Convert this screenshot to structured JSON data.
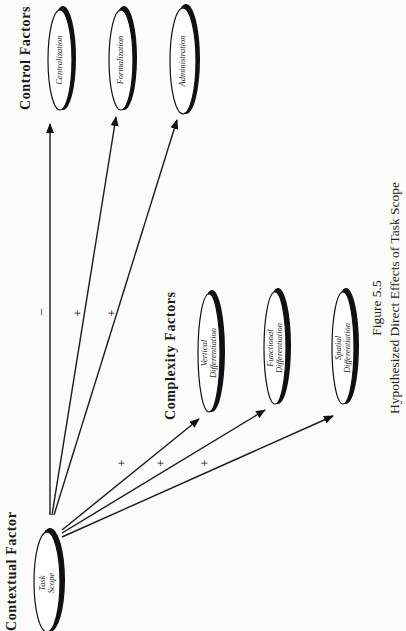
{
  "figure": {
    "number": "Figure 5.5",
    "title": "Hypothesized Direct Effects of Task Scope"
  },
  "groups": {
    "contextual": "Contextual Factor",
    "complexity": "Complexity Factors",
    "control": "Control Factors"
  },
  "nodes": {
    "task_scope": {
      "line1": "Task",
      "line2": "Scope"
    },
    "vertical": {
      "line1": "Vertical",
      "line2": "Differentiation"
    },
    "functional": {
      "line1": "Functional",
      "line2": "Differentiation"
    },
    "spatial": {
      "line1": "Spatial",
      "line2": "Differentiation"
    },
    "centralization": {
      "line1": "Centralization"
    },
    "formalization": {
      "line1": "Formalization"
    },
    "administration": {
      "line1": "Administration"
    }
  },
  "edges": [
    {
      "from": "Task Scope",
      "to": "Centralization",
      "sign": "–"
    },
    {
      "from": "Task Scope",
      "to": "Formalization",
      "sign": "+"
    },
    {
      "from": "Task Scope",
      "to": "Administration",
      "sign": "+"
    },
    {
      "from": "Task Scope",
      "to": "Vertical Differentiation",
      "sign": "+"
    },
    {
      "from": "Task Scope",
      "to": "Functional Differentiation",
      "sign": "+"
    },
    {
      "from": "Task Scope",
      "to": "Spatial Differentiation",
      "sign": "+"
    }
  ]
}
